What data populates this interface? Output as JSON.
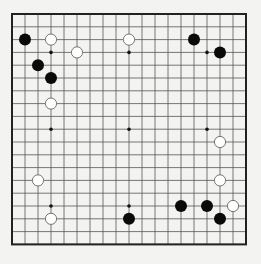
{
  "board": {
    "size": 19,
    "origin_x": 12,
    "origin_y": 14,
    "spacing_x": 13.0,
    "spacing_y": 12.8,
    "line_color": "#555555",
    "border_color": "#222222",
    "background": "#f3f3f1",
    "star_points": [
      [
        3,
        3
      ],
      [
        9,
        3
      ],
      [
        15,
        3
      ],
      [
        3,
        9
      ],
      [
        9,
        9
      ],
      [
        15,
        9
      ],
      [
        3,
        15
      ],
      [
        9,
        15
      ],
      [
        15,
        15
      ]
    ]
  },
  "stones": [
    {
      "color": "black",
      "col": 1,
      "row": 2
    },
    {
      "color": "white",
      "col": 3,
      "row": 2
    },
    {
      "color": "white",
      "col": 5,
      "row": 3
    },
    {
      "color": "black",
      "col": 2,
      "row": 4
    },
    {
      "color": "black",
      "col": 3,
      "row": 5
    },
    {
      "color": "white",
      "col": 3,
      "row": 7
    },
    {
      "color": "white",
      "col": 9,
      "row": 2
    },
    {
      "color": "black",
      "col": 14,
      "row": 2
    },
    {
      "color": "black",
      "col": 16,
      "row": 3
    },
    {
      "color": "white",
      "col": 16,
      "row": 10
    },
    {
      "color": "white",
      "col": 16,
      "row": 13
    },
    {
      "color": "white",
      "col": 2,
      "row": 13
    },
    {
      "color": "white",
      "col": 3,
      "row": 16
    },
    {
      "color": "black",
      "col": 9,
      "row": 16
    },
    {
      "color": "black",
      "col": 13,
      "row": 15
    },
    {
      "color": "black",
      "col": 15,
      "row": 15
    },
    {
      "color": "white",
      "col": 17,
      "row": 15
    },
    {
      "color": "black",
      "col": 16,
      "row": 16
    }
  ]
}
